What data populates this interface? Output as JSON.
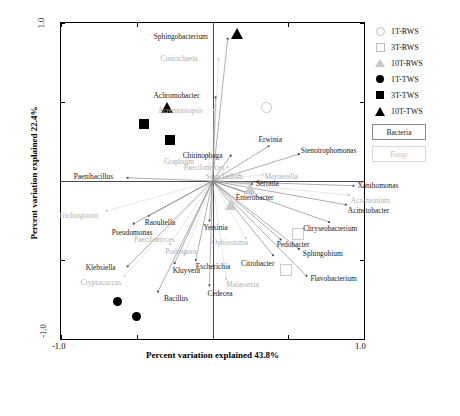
{
  "chart_data": {
    "type": "scatter",
    "title": "",
    "xlabel": "Percent variation explained 43.8%",
    "ylabel": "Percent variation explained 22.4%",
    "xlim": [
      -1.0,
      1.0
    ],
    "ylim": [
      -1.0,
      1.0
    ],
    "xticks": [
      "-1.0",
      "1.0"
    ],
    "yticks": [
      "1.0",
      "-1.0"
    ],
    "grid": false,
    "legend_position": "right",
    "legend": [
      {
        "label": "1T-RWS",
        "symbol": "circle-open"
      },
      {
        "label": "3T-RWS",
        "symbol": "square-open"
      },
      {
        "label": "10T-RWS",
        "symbol": "triangle-open"
      },
      {
        "label": "1T-TWS",
        "symbol": "circle-filled"
      },
      {
        "label": "3T-TWS",
        "symbol": "square-filled"
      },
      {
        "label": "10T-TWS",
        "symbol": "triangle-filled"
      }
    ],
    "keys": [
      {
        "label": "Bacteria",
        "color": "#1a1a1a"
      },
      {
        "label": "Fungi",
        "color": "#c4c4c4"
      }
    ],
    "samples": [
      {
        "name": "10T-TWS",
        "symbol": "triangle-filled",
        "x": 0.16,
        "y": 0.93
      },
      {
        "name": "10T-TWS",
        "symbol": "triangle-filled",
        "x": -0.3,
        "y": 0.46
      },
      {
        "name": "3T-TWS",
        "symbol": "square-filled",
        "x": -0.45,
        "y": 0.36
      },
      {
        "name": "3T-TWS",
        "symbol": "square-filled",
        "x": -0.28,
        "y": 0.26
      },
      {
        "name": "1T-RWS",
        "symbol": "circle-open",
        "x": 0.35,
        "y": 0.47
      },
      {
        "name": "10T-RWS",
        "symbol": "triangle-open",
        "x": 0.25,
        "y": -0.05
      },
      {
        "name": "10T-RWS",
        "symbol": "triangle-open",
        "x": 0.12,
        "y": -0.15
      },
      {
        "name": "3T-RWS",
        "symbol": "square-open",
        "x": 0.56,
        "y": -0.33
      },
      {
        "name": "3T-RWS",
        "symbol": "square-open",
        "x": 0.48,
        "y": -0.56
      },
      {
        "name": "1T-TWS",
        "symbol": "circle-filled",
        "x": -0.63,
        "y": -0.76
      },
      {
        "name": "1T-TWS",
        "symbol": "circle-filled",
        "x": -0.5,
        "y": -0.86
      }
    ],
    "vectors": [
      {
        "label": "Sphingobacterium",
        "group": "Bacteria",
        "x": 0.1,
        "y": 0.9
      },
      {
        "label": "Coniochaeta",
        "group": "Fungi",
        "x": 0.04,
        "y": 0.77
      },
      {
        "label": "Achromobacter",
        "group": "Bacteria",
        "x": 0.02,
        "y": 0.53
      },
      {
        "label": "Acremoniopsis",
        "group": "Fungi",
        "x": 0.01,
        "y": 0.45
      },
      {
        "label": "Graphium",
        "group": "Fungi",
        "x": -0.03,
        "y": 0.16
      },
      {
        "label": "Chitinophaga",
        "group": "Bacteria",
        "x": 0.12,
        "y": 0.16
      },
      {
        "label": "Erwinia",
        "group": "Bacteria",
        "x": 0.37,
        "y": 0.22
      },
      {
        "label": "Stenotrophomonas",
        "group": "Bacteria",
        "x": 0.57,
        "y": 0.17
      },
      {
        "label": "Paecilomyces",
        "group": "Fungi",
        "x": 0.1,
        "y": 0.09
      },
      {
        "label": "Sarocladium",
        "group": "Fungi",
        "x": 0.18,
        "y": 0.04
      },
      {
        "label": "Mortierella",
        "group": "Fungi",
        "x": 0.33,
        "y": 0.04
      },
      {
        "label": "Serratia",
        "group": "Bacteria",
        "x": 0.26,
        "y": -0.02
      },
      {
        "label": "Enterobacter",
        "group": "Bacteria",
        "x": 0.22,
        "y": -0.07
      },
      {
        "label": "Xanthomonas",
        "group": "Bacteria",
        "x": 0.93,
        "y": -0.03
      },
      {
        "label": "Acremonium",
        "group": "Fungi",
        "x": 0.9,
        "y": -0.09
      },
      {
        "label": "Acinetobacter",
        "group": "Bacteria",
        "x": 0.88,
        "y": -0.15
      },
      {
        "label": "Paenibacillus",
        "group": "Bacteria",
        "x": -0.56,
        "y": 0.02
      },
      {
        "label": "Trichosporon",
        "group": "Fungi",
        "x": -0.7,
        "y": -0.19
      },
      {
        "label": "Raoultella",
        "group": "Bacteria",
        "x": -0.42,
        "y": -0.22
      },
      {
        "label": "Pseudomonas",
        "group": "Bacteria",
        "x": -0.52,
        "y": -0.27
      },
      {
        "label": "Yersinia",
        "group": "Bacteria",
        "x": -0.02,
        "y": -0.25
      },
      {
        "label": "Chryseobacterium",
        "group": "Bacteria",
        "x": 0.77,
        "y": -0.26
      },
      {
        "label": "Pedobacter",
        "group": "Bacteria",
        "x": 0.45,
        "y": -0.37
      },
      {
        "label": "Sphingobium",
        "group": "Bacteria",
        "x": 0.57,
        "y": -0.43
      },
      {
        "label": "Citrobacter",
        "group": "Bacteria",
        "x": 0.4,
        "y": -0.47
      },
      {
        "label": "Ophiostoma",
        "group": "Fungi",
        "x": 0.22,
        "y": -0.36
      },
      {
        "label": "Flavobacterium",
        "group": "Bacteria",
        "x": 0.62,
        "y": -0.6
      },
      {
        "label": "Malassezia",
        "group": "Fungi",
        "x": 0.09,
        "y": -0.62
      },
      {
        "label": "Paecilomyces",
        "group": "Fungi",
        "x": -0.28,
        "y": -0.4
      },
      {
        "label": "Podospora",
        "group": "Fungi",
        "x": -0.18,
        "y": -0.46
      },
      {
        "label": "Escherichia",
        "group": "Bacteria",
        "x": -0.11,
        "y": -0.5
      },
      {
        "label": "Kluyvera",
        "group": "Bacteria",
        "x": -0.25,
        "y": -0.52
      },
      {
        "label": "Klebsiella",
        "group": "Bacteria",
        "x": -0.56,
        "y": -0.54
      },
      {
        "label": "Cryptococcus",
        "group": "Fungi",
        "x": -0.58,
        "y": -0.6
      },
      {
        "label": "Bacillus",
        "group": "Bacteria",
        "x": -0.36,
        "y": -0.7
      },
      {
        "label": "Cedecea",
        "group": "Bacteria",
        "x": -0.02,
        "y": -0.66
      }
    ]
  }
}
